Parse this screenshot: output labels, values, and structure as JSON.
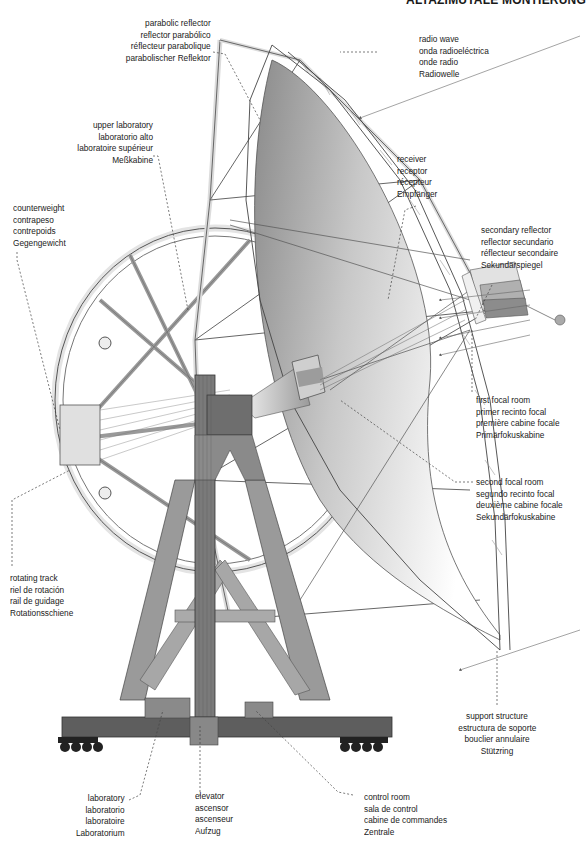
{
  "title": "ALTAZIMUTALE MONTIERUNG",
  "diagram": {
    "colors": {
      "structure_dark": "#6e6e6e",
      "structure_mid": "#9a9a9a",
      "structure_light": "#d6d6d6",
      "dish_gradient_dark": "#8a8a8a",
      "dish_gradient_light": "#ffffff",
      "outline": "#333333",
      "leader_line": "#444444"
    }
  },
  "labels": {
    "parabolic_reflector": [
      "parabolic reflector",
      "reflector parabólico",
      "réflecteur parabolique",
      "parabolischer Reflektor"
    ],
    "radio_wave": [
      "radio wave",
      "onda radioeléctrica",
      "onde radio",
      "Radiowelle"
    ],
    "upper_laboratory": [
      "upper laboratory",
      "laboratorio alto",
      "laboratoire supérieur",
      "Meßkabine"
    ],
    "receiver": [
      "receiver",
      "receptor",
      "récepteur",
      "Empfänger"
    ],
    "counterweight": [
      "counterweight",
      "contrapeso",
      "contrepoids",
      "Gegengewicht"
    ],
    "secondary_reflector": [
      "secondary reflector",
      "reflector secundario",
      "réflecteur secondaire",
      "Sekundärspiegel"
    ],
    "first_focal_room": [
      "first focal room",
      "primer recinto focal",
      "première cabine focale",
      "Primärfokuskabine"
    ],
    "second_focal_room": [
      "second focal room",
      "segundo recinto focal",
      "deuxième cabine focale",
      "Sekundärfokuskabine"
    ],
    "rotating_track": [
      "rotating track",
      "riel de rotación",
      "rail de guidage",
      "Rotationsschiene"
    ],
    "support_structure": [
      "support structure",
      "estructura de soporte",
      "bouclier annulaire",
      "Stützring"
    ],
    "laboratory": [
      "laboratory",
      "laboratorio",
      "laboratoire",
      "Laboratorium"
    ],
    "elevator": [
      "elevator",
      "ascensor",
      "ascenseur",
      "Aufzug"
    ],
    "control_room": [
      "control room",
      "sala de control",
      "cabine de commandes",
      "Zentrale"
    ]
  }
}
